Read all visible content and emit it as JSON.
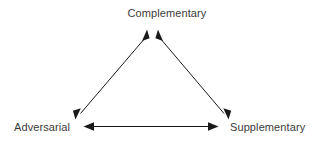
{
  "diagram": {
    "type": "triangle-relationship-diagram",
    "title": "",
    "background_color": "#ffffff",
    "line_color": "#1a1a1a",
    "text_color": "#3b3b3b",
    "nodes": [
      {
        "id": "complementary",
        "label": "Complementary",
        "position": "top",
        "x": 152,
        "y": 30
      },
      {
        "id": "adversarial",
        "label": "Adversarial",
        "position": "bottom-left",
        "x": 76,
        "y": 118
      },
      {
        "id": "supplementary",
        "label": "Supplementary",
        "position": "bottom-right",
        "x": 228,
        "y": 118
      }
    ],
    "edges": [
      {
        "id": "edge-adversarial-complementary",
        "from": "adversarial",
        "to": "complementary",
        "arrow_style": "double-headed",
        "orientation": "diagonal-left"
      },
      {
        "id": "edge-complementary-supplementary",
        "from": "complementary",
        "to": "supplementary",
        "arrow_style": "double-headed",
        "orientation": "diagonal-right"
      },
      {
        "id": "edge-adversarial-supplementary",
        "from": "adversarial",
        "to": "supplementary",
        "arrow_style": "double-headed",
        "orientation": "horizontal"
      }
    ]
  }
}
